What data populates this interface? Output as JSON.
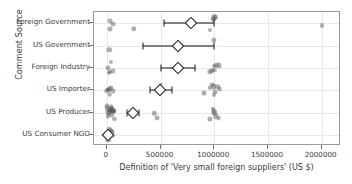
{
  "chart_data": {
    "type": "scatter",
    "title": "",
    "xlabel": "Definition of 'Very small foreign suppliers' (US $)",
    "ylabel": "Comment Source",
    "xlim": [
      -120000,
      2180000
    ],
    "xticks": [
      0,
      500000,
      1000000,
      1500000,
      2000000
    ],
    "xticklabels": [
      "0",
      "500000",
      "1000000",
      "1500000",
      "2000000"
    ],
    "categories": [
      "Foreign Government",
      "US Government",
      "Foreign Industry",
      "US Importer",
      "US Producer",
      "US Consumer NGO"
    ],
    "grid": true,
    "legend": null,
    "marker_color": "#4d4d4d",
    "mean_marker_color": "#111111",
    "series": [
      {
        "name": "Foreign Government",
        "points": [
          25000,
          30000,
          60000,
          250000,
          960000,
          990000,
          1000000,
          1010000,
          2000000
        ],
        "mean": 780000,
        "ci_low": 530000,
        "ci_high": 1000000
      },
      {
        "name": "US Government",
        "points": [
          20000,
          1000000
        ],
        "mean": 660000,
        "ci_low": 340000,
        "ci_high": 1000000
      },
      {
        "name": "Foreign Industry",
        "points": [
          10000,
          20000,
          30000,
          40000,
          60000,
          960000,
          980000,
          1000000,
          1000000,
          1020000,
          1040000
        ],
        "mean": 665000,
        "ci_low": 505000,
        "ci_high": 820000
      },
      {
        "name": "US Importer",
        "points": [
          5000,
          10000,
          20000,
          25000,
          40000,
          60000,
          480000,
          500000,
          505000,
          960000,
          980000,
          1000000,
          1000000,
          1010000,
          1030000,
          1050000,
          900000
        ],
        "mean": 495000,
        "ci_low": 400000,
        "ci_high": 610000
      },
      {
        "name": "US Producer",
        "points": [
          0,
          5000,
          10000,
          15000,
          20000,
          25000,
          30000,
          35000,
          40000,
          45000,
          50000,
          55000,
          60000,
          65000,
          70000,
          440000,
          470000,
          960000,
          985000,
          1000000,
          1000000,
          1015000,
          1040000
        ],
        "mean": 240000,
        "ci_low": 185000,
        "ci_high": 295000
      },
      {
        "name": "US Consumer NGO",
        "points": [
          0,
          5000,
          8000,
          12000,
          18000,
          22000,
          28000,
          35000,
          45000,
          55000
        ],
        "mean": 15000,
        "ci_low": 5000,
        "ci_high": 28000
      }
    ]
  }
}
